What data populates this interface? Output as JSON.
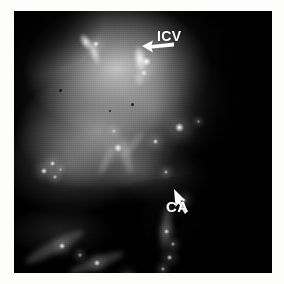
{
  "figure": {
    "kind": "fluorescence-micrograph",
    "modality": "grayscale",
    "border_color": "#ffffff",
    "background_color": "#000000",
    "plate": {
      "x": 14,
      "y": 11,
      "width": 258,
      "height": 262
    }
  },
  "annotations": [
    {
      "id": "icv",
      "label": "ICV",
      "color": "#ffffff",
      "label_x": 157,
      "label_y": 29,
      "arrow": {
        "from_x": 158,
        "from_y": 32,
        "to_x": 129,
        "to_y": 40,
        "direction": "left-down"
      }
    },
    {
      "id": "ca",
      "label": "CA",
      "color": "#ffffff",
      "label_x": 166,
      "label_y": 199,
      "arrow": {
        "from_x": 180,
        "from_y": 204,
        "to_x": 160,
        "to_y": 180,
        "direction": "up-left"
      }
    }
  ],
  "features": {
    "streaks": [
      {
        "name": "vessel-streak-upper-left",
        "x": 72,
        "y": 31,
        "w": 10,
        "h": 18,
        "rot": -32,
        "color": "rgba(250,250,250,0.95)",
        "blur": 1.2
      },
      {
        "name": "vessel-streak-icv-upper",
        "x": 80,
        "y": 42,
        "w": 9,
        "h": 24,
        "rot": -18,
        "color": "rgba(238,238,238,0.88)",
        "blur": 1.4
      },
      {
        "name": "vessel-streak-icv-main",
        "x": 126,
        "y": 48,
        "w": 12,
        "h": 26,
        "rot": -8,
        "color": "rgba(255,255,255,0.97)",
        "blur": 1.2
      },
      {
        "name": "vessel-streak-icv-tail",
        "x": 125,
        "y": 68,
        "w": 9,
        "h": 14,
        "rot": -6,
        "color": "rgba(205,205,205,0.65)",
        "blur": 1.6
      },
      {
        "name": "vessel-streak-mid-left",
        "x": 92,
        "y": 150,
        "w": 8,
        "h": 30,
        "rot": 26,
        "color": "rgba(160,160,160,0.55)",
        "blur": 2.0
      },
      {
        "name": "vessel-streak-mid-center",
        "x": 112,
        "y": 146,
        "w": 9,
        "h": 34,
        "rot": -14,
        "color": "rgba(168,168,168,0.58)",
        "blur": 2.0
      },
      {
        "name": "vessel-streak-diagonal",
        "x": 120,
        "y": 132,
        "w": 7,
        "h": 30,
        "rot": 38,
        "color": "rgba(150,150,150,0.50)",
        "blur": 2.2
      },
      {
        "name": "vessel-streak-ca-shaft",
        "x": 152,
        "y": 216,
        "w": 10,
        "h": 46,
        "rot": 6,
        "color": "rgba(150,150,150,0.48)",
        "blur": 2.4
      },
      {
        "name": "vessel-streak-lower-left",
        "x": 40,
        "y": 236,
        "w": 13,
        "h": 66,
        "rot": 62,
        "color": "rgba(130,130,130,0.46)",
        "blur": 2.6
      },
      {
        "name": "vessel-streak-bottom-edge",
        "x": 82,
        "y": 252,
        "w": 11,
        "h": 58,
        "rot": 70,
        "color": "rgba(120,120,120,0.40)",
        "blur": 2.6
      }
    ],
    "dots": [
      {
        "name": "bright-punctum-1",
        "x": 82,
        "y": 33,
        "d": 6,
        "color": "rgba(255,255,255,0.98)"
      },
      {
        "name": "bright-punctum-2",
        "x": 132,
        "y": 50,
        "d": 9,
        "color": "rgba(255,255,255,1.0)"
      },
      {
        "name": "bright-punctum-3",
        "x": 130,
        "y": 62,
        "d": 6,
        "color": "rgba(248,248,248,0.88)"
      },
      {
        "name": "bright-punctum-4",
        "x": 165,
        "y": 116,
        "d": 9,
        "color": "rgba(255,255,255,1.0)"
      },
      {
        "name": "bright-punctum-5",
        "x": 141,
        "y": 130,
        "d": 5,
        "color": "rgba(240,240,240,0.92)"
      },
      {
        "name": "bright-punctum-6",
        "x": 104,
        "y": 137,
        "d": 8,
        "color": "rgba(255,255,255,0.96)"
      },
      {
        "name": "bright-punctum-7",
        "x": 100,
        "y": 120,
        "d": 4,
        "color": "rgba(225,225,225,0.80)"
      },
      {
        "name": "bright-punctum-8",
        "x": 38,
        "y": 152,
        "d": 5,
        "color": "rgba(250,250,250,0.92)"
      },
      {
        "name": "bright-punctum-9",
        "x": 30,
        "y": 160,
        "d": 6,
        "color": "rgba(255,255,255,0.95)"
      },
      {
        "name": "bright-punctum-10",
        "x": 41,
        "y": 166,
        "d": 4,
        "color": "rgba(235,235,235,0.82)"
      },
      {
        "name": "bright-punctum-11",
        "x": 46,
        "y": 158,
        "d": 3,
        "color": "rgba(220,220,220,0.70)"
      },
      {
        "name": "bright-punctum-12",
        "x": 152,
        "y": 161,
        "d": 4,
        "color": "rgba(235,235,235,0.80)"
      },
      {
        "name": "bright-punctum-13",
        "x": 169,
        "y": 189,
        "d": 5,
        "color": "rgba(250,250,250,0.90)"
      },
      {
        "name": "bright-punctum-14",
        "x": 152,
        "y": 220,
        "d": 5,
        "color": "rgba(245,245,245,0.88)"
      },
      {
        "name": "bright-punctum-15",
        "x": 159,
        "y": 233,
        "d": 4,
        "color": "rgba(230,230,230,0.78)"
      },
      {
        "name": "bright-punctum-16",
        "x": 155,
        "y": 246,
        "d": 5,
        "color": "rgba(240,240,240,0.82)"
      },
      {
        "name": "bright-punctum-17",
        "x": 149,
        "y": 258,
        "d": 4,
        "color": "rgba(225,225,225,0.72)"
      },
      {
        "name": "bright-punctum-18",
        "x": 48,
        "y": 235,
        "d": 6,
        "color": "rgba(255,255,255,0.95)"
      },
      {
        "name": "bright-punctum-19",
        "x": 83,
        "y": 252,
        "d": 6,
        "color": "rgba(250,250,250,0.92)"
      },
      {
        "name": "bright-punctum-20",
        "x": 113,
        "y": 265,
        "d": 5,
        "color": "rgba(240,240,240,0.86)"
      },
      {
        "name": "bright-punctum-21",
        "x": 66,
        "y": 244,
        "d": 4,
        "color": "rgba(215,215,215,0.70)"
      },
      {
        "name": "bright-punctum-22",
        "x": 184,
        "y": 110,
        "d": 3,
        "color": "rgba(200,200,200,0.60)"
      }
    ],
    "specks": [
      {
        "name": "dark-speck-1",
        "x": 46,
        "y": 79,
        "d": 3
      },
      {
        "name": "dark-speck-2",
        "x": 118,
        "y": 93,
        "d": 3
      },
      {
        "name": "dark-speck-3",
        "x": 231,
        "y": 44,
        "d": 3
      },
      {
        "name": "dark-speck-4",
        "x": 96,
        "y": 100,
        "d": 2
      }
    ]
  }
}
